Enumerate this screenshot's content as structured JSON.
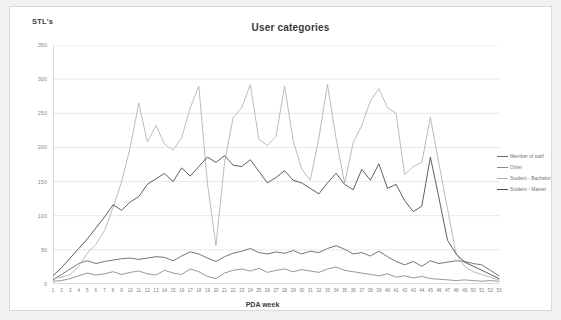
{
  "chart_data": {
    "type": "line",
    "title": "User categories",
    "xlabel": "PDA week",
    "ylabel": "STL's",
    "ylim": [
      0,
      350
    ],
    "yticks": [
      0,
      50,
      100,
      150,
      200,
      250,
      300,
      350
    ],
    "grid": true,
    "legend_position": "right",
    "categories": [
      1,
      2,
      3,
      4,
      5,
      6,
      7,
      8,
      9,
      10,
      11,
      12,
      13,
      14,
      15,
      16,
      17,
      18,
      19,
      20,
      21,
      22,
      23,
      24,
      25,
      26,
      27,
      28,
      29,
      30,
      31,
      32,
      33,
      34,
      35,
      36,
      37,
      38,
      39,
      40,
      41,
      42,
      43,
      44,
      45,
      46,
      47,
      48,
      49,
      50,
      51,
      52,
      53
    ],
    "series": [
      {
        "name": "Member of staff",
        "color": "#666666",
        "values": [
          6,
          14,
          22,
          30,
          34,
          30,
          33,
          35,
          37,
          38,
          36,
          38,
          40,
          39,
          34,
          41,
          47,
          44,
          38,
          33,
          40,
          45,
          48,
          52,
          46,
          44,
          47,
          45,
          49,
          44,
          48,
          46,
          52,
          56,
          51,
          44,
          46,
          41,
          48,
          40,
          33,
          28,
          33,
          26,
          34,
          30,
          32,
          34,
          33,
          30,
          28,
          20,
          12
        ]
      },
      {
        "name": "Other",
        "color": "#8c8c8c",
        "values": [
          4,
          5,
          8,
          12,
          16,
          13,
          15,
          18,
          14,
          17,
          19,
          15,
          13,
          20,
          16,
          14,
          22,
          18,
          11,
          8,
          16,
          20,
          22,
          19,
          23,
          17,
          20,
          22,
          18,
          21,
          19,
          17,
          22,
          25,
          20,
          18,
          16,
          14,
          12,
          15,
          10,
          12,
          9,
          11,
          8,
          7,
          6,
          5,
          6,
          5,
          4,
          5,
          4
        ]
      },
      {
        "name": "Student - Bachelor",
        "color": "#b3b3b3",
        "values": [
          8,
          10,
          14,
          26,
          45,
          58,
          78,
          112,
          150,
          200,
          265,
          208,
          232,
          205,
          196,
          214,
          258,
          290,
          148,
          56,
          178,
          244,
          258,
          292,
          212,
          203,
          216,
          290,
          210,
          168,
          152,
          214,
          292,
          213,
          148,
          207,
          232,
          268,
          286,
          258,
          250,
          160,
          172,
          178,
          244,
          176,
          110,
          44,
          26,
          18,
          14,
          10,
          6
        ]
      },
      {
        "name": "Student - Master",
        "color": "#4d4d4d",
        "values": [
          12,
          24,
          38,
          52,
          66,
          82,
          98,
          116,
          108,
          120,
          128,
          146,
          154,
          162,
          150,
          170,
          158,
          172,
          186,
          178,
          188,
          174,
          172,
          182,
          165,
          148,
          156,
          166,
          152,
          148,
          140,
          132,
          148,
          162,
          146,
          138,
          168,
          152,
          176,
          140,
          146,
          122,
          106,
          114,
          186,
          126,
          64,
          44,
          32,
          26,
          20,
          14,
          8
        ]
      }
    ]
  },
  "legend": {
    "items": [
      {
        "label": "Member of staff"
      },
      {
        "label": "Other"
      },
      {
        "label": "Student - Bachelor"
      },
      {
        "label": "Student - Master"
      }
    ]
  }
}
